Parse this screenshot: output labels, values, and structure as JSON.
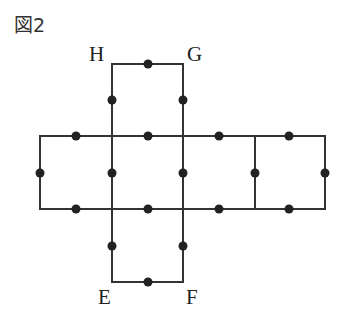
{
  "figure": {
    "title": "図2",
    "labels": {
      "H": "H",
      "G": "G",
      "E": "E",
      "F": "F"
    },
    "line_color": "#333333",
    "dot_color": "#222222"
  }
}
